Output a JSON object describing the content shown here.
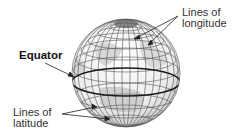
{
  "diagram": {
    "labels": {
      "longitude": {
        "line1": "Lines of",
        "line2": "longitude"
      },
      "equator": "Equator",
      "latitude": {
        "line1": "Lines of",
        "line2": "latitude"
      }
    },
    "colors": {
      "globe_fill": "#f2f2f2",
      "land": "#d6d6d6",
      "grid": "#555555",
      "equator": "#1a1a1a",
      "text": "#333333"
    }
  }
}
